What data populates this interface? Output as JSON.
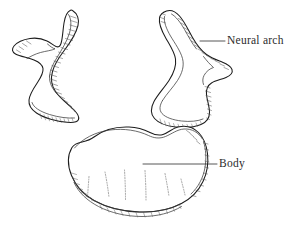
{
  "figure": {
    "background_color": "#ffffff",
    "ink_color": "#1c1c1c",
    "width": 305,
    "height": 231
  },
  "labels": [
    {
      "id": "neural-arch",
      "text": "Neural arch",
      "leader_from_x": 200,
      "leader_from_y": 41,
      "leader_to_x": 225,
      "leader_to_y": 41
    },
    {
      "id": "body",
      "text": "Body",
      "leader_from_x": 143,
      "leader_from_y": 164,
      "leader_to_x": 217,
      "leader_to_y": 164
    }
  ],
  "structures": [
    {
      "id": "left-neural-arch",
      "name": "Left neural arch half",
      "position": "upper-left"
    },
    {
      "id": "right-neural-arch",
      "name": "Right neural arch half",
      "position": "upper-right"
    },
    {
      "id": "vertebral-body",
      "name": "Vertebral body",
      "position": "lower-center"
    }
  ]
}
